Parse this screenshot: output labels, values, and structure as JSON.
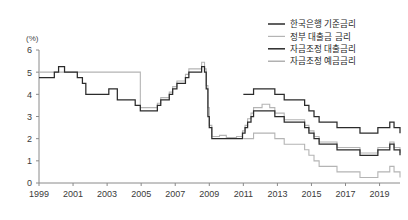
{
  "chart_data": {
    "type": "line",
    "title": "",
    "subtitle": "",
    "xlabel": "",
    "ylabel": "(%)",
    "unit_label": "(%)",
    "grid": false,
    "legend_position": "top-right",
    "xlim": [
      1999,
      2020.2
    ],
    "ylim": [
      0,
      6
    ],
    "ytick_values": [
      0,
      1,
      2,
      3,
      4,
      5,
      6
    ],
    "ytick_labels": [
      "0",
      "1",
      "2",
      "3",
      "4",
      "5",
      "6"
    ],
    "xtick_values": [
      1999,
      2001,
      2003,
      2005,
      2007,
      2009,
      2011,
      2013,
      2015,
      2017,
      2019
    ],
    "xtick_labels": [
      "1999",
      "2001",
      "2003",
      "2005",
      "2007",
      "2009",
      "2011",
      "2013",
      "2015",
      "2017",
      "2019"
    ],
    "step_style": "post",
    "series": [
      {
        "name": "한국은행 기준금리",
        "color": "#2b2b2b",
        "width": 1.25,
        "x": [
          1999.0,
          1999.4,
          1999.9,
          2000.15,
          2000.5,
          2001.0,
          2001.25,
          2001.55,
          2001.75,
          2002.6,
          2003.1,
          2003.4,
          2003.6,
          2004.25,
          2004.65,
          2004.95,
          2005.75,
          2005.95,
          2006.15,
          2006.4,
          2006.65,
          2006.85,
          2007.1,
          2007.35,
          2007.6,
          2007.8,
          2008.0,
          2008.3,
          2008.55,
          2008.72,
          2008.82,
          2008.92,
          2009.0,
          2009.15,
          2010.6,
          2010.95,
          2011.1,
          2011.25,
          2011.45,
          2011.6,
          2012.55,
          2012.85,
          2013.4,
          2014.6,
          2014.85,
          2015.15,
          2015.45,
          2016.5,
          2017.85,
          2018.9,
          2019.6,
          2019.85,
          2020.2
        ],
        "y": [
          4.75,
          4.75,
          5.0,
          5.25,
          5.0,
          5.0,
          4.75,
          4.5,
          4.0,
          4.0,
          4.25,
          4.25,
          3.75,
          3.75,
          3.5,
          3.25,
          3.25,
          3.5,
          3.75,
          3.75,
          4.0,
          4.25,
          4.5,
          4.5,
          4.75,
          5.0,
          5.0,
          5.0,
          5.25,
          5.0,
          4.25,
          3.0,
          2.5,
          2.0,
          2.0,
          2.25,
          2.5,
          2.75,
          3.0,
          3.25,
          3.25,
          3.0,
          2.75,
          2.5,
          2.25,
          2.0,
          1.75,
          1.5,
          1.25,
          1.5,
          1.75,
          1.5,
          1.25
        ]
      },
      {
        "name": "정부 대출금 금리",
        "color": "#b4b4b4",
        "width": 1.1,
        "x": [
          1999.0,
          2004.5,
          2004.95,
          2005.75,
          2005.95,
          2006.15,
          2006.4,
          2006.65,
          2006.85,
          2007.1,
          2007.35,
          2007.6,
          2007.8,
          2008.0,
          2008.3,
          2008.55,
          2008.72,
          2008.82,
          2008.92,
          2009.0,
          2009.15,
          2009.6,
          2010.0,
          2010.6,
          2010.95,
          2011.1,
          2011.25,
          2011.45,
          2011.6,
          2012.1,
          2012.55,
          2012.85,
          2013.4,
          2014.6,
          2014.85,
          2015.15,
          2015.45,
          2016.5,
          2017.85,
          2018.9,
          2019.6,
          2019.85,
          2020.2
        ],
        "y": [
          5.0,
          5.0,
          3.4,
          3.4,
          3.6,
          3.85,
          3.85,
          4.1,
          4.35,
          4.6,
          4.6,
          4.9,
          5.15,
          5.15,
          5.15,
          5.45,
          5.15,
          4.4,
          3.4,
          2.6,
          2.1,
          2.15,
          2.05,
          2.1,
          2.35,
          2.6,
          2.9,
          3.15,
          3.4,
          3.55,
          3.4,
          3.15,
          2.85,
          2.6,
          2.35,
          2.1,
          1.85,
          1.6,
          1.35,
          1.6,
          1.85,
          1.6,
          1.35
        ]
      },
      {
        "name": "자금조정 대출금리",
        "color": "#2b2b2b",
        "width": 1.25,
        "x": [
          2011.0,
          2011.45,
          2011.6,
          2012.55,
          2012.85,
          2013.4,
          2014.6,
          2014.85,
          2015.15,
          2015.45,
          2016.5,
          2017.85,
          2018.9,
          2019.6,
          2019.85,
          2020.2
        ],
        "y": [
          4.0,
          4.0,
          4.25,
          4.25,
          4.0,
          3.75,
          3.5,
          3.25,
          3.0,
          2.75,
          2.5,
          2.25,
          2.5,
          2.75,
          2.5,
          2.25
        ]
      },
      {
        "name": "자금조정 예금금리",
        "color": "#b4b4b4",
        "width": 1.1,
        "x": [
          2011.0,
          2011.45,
          2011.6,
          2012.55,
          2012.85,
          2013.4,
          2014.6,
          2014.85,
          2015.15,
          2015.45,
          2016.5,
          2017.85,
          2018.9,
          2019.6,
          2019.85,
          2020.2
        ],
        "y": [
          2.0,
          2.0,
          2.25,
          2.25,
          2.0,
          1.75,
          1.5,
          1.25,
          1.0,
          0.75,
          0.5,
          0.25,
          0.5,
          0.75,
          0.5,
          0.25
        ]
      }
    ],
    "legend_entries": [
      {
        "label": "한국은행 기준금리",
        "color": "#2b2b2b"
      },
      {
        "label": "정부 대출금 금리",
        "color": "#b4b4b4"
      },
      {
        "label": "자금조정 대출금리",
        "color": "#2b2b2b"
      },
      {
        "label": "자금조정 예금금리",
        "color": "#9e9e9e"
      }
    ]
  },
  "colors": {
    "background": "#ffffff",
    "axis": "#8a8a8a",
    "text": "#3a3a3a",
    "dark_series": "#2b2b2b",
    "light_series": "#b4b4b4",
    "top_rule": "#b8b8b8"
  }
}
